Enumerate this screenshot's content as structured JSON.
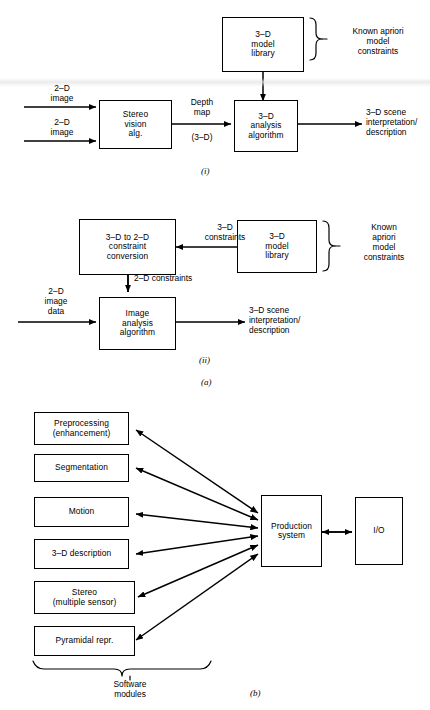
{
  "page": {
    "faint_header": "",
    "background": "#ffffff",
    "ink": "#000000"
  },
  "figure": {
    "caption_a": "(a)",
    "caption_b": "(b)",
    "caption_i": "(i)",
    "caption_ii": "(ii)"
  },
  "diagram_i": {
    "boxes": {
      "model_library": "3–D\nmodel\nlibrary",
      "stereo_vision": "Stereo\nvision\nalg.",
      "analysis": "3–D\nanalysis\nalgorithm"
    },
    "labels": {
      "brace_text": "Known apriori\nmodel\nconstraints",
      "input_top": "2–D\nimage",
      "input_bottom": "2–D\nimage",
      "depth_map": "Depth\nmap",
      "depth_map_sub": "(3–D)",
      "output": "3–D scene\ninterpretation/\ndescription"
    }
  },
  "diagram_ii": {
    "boxes": {
      "conversion": "3–D to 2–D\nconstraint\nconversion",
      "model_library": "3–D\nmodel\nlibrary",
      "image_analysis": "Image\nanalysis\nalgorithm"
    },
    "labels": {
      "brace_text": "Known\napriori\nmodel\nconstraints",
      "constraints_3d": "3–D\nconstraints",
      "constraints_2d": "2–D constraints",
      "input": "2–D\nimage\ndata",
      "output": "3–D scene\ninterpretation/\ndescription"
    }
  },
  "diagram_b": {
    "modules": [
      "Preprocessing\n(enhancement)",
      "Segmentation",
      "Motion",
      "3–D description",
      "Stereo\n(multiple sensor)",
      "Pyramidal repr."
    ],
    "boxes": {
      "production_system": "Production\nsystem",
      "io": "I/O"
    },
    "labels": {
      "brace_text": "Software\nmodules"
    }
  }
}
